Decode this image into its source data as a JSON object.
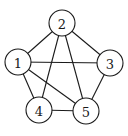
{
  "graph": {
    "nodes": [
      {
        "id": "1",
        "label": "1",
        "x": 18,
        "y": 62
      },
      {
        "id": "2",
        "label": "2",
        "x": 62,
        "y": 23
      },
      {
        "id": "3",
        "label": "3",
        "x": 110,
        "y": 63
      },
      {
        "id": "4",
        "label": "4",
        "x": 39,
        "y": 110
      },
      {
        "id": "5",
        "label": "5",
        "x": 86,
        "y": 111
      }
    ],
    "edges": [
      [
        "1",
        "2"
      ],
      [
        "2",
        "3"
      ],
      [
        "1",
        "3"
      ],
      [
        "1",
        "4"
      ],
      [
        "1",
        "5"
      ],
      [
        "2",
        "4"
      ],
      [
        "2",
        "5"
      ],
      [
        "3",
        "5"
      ],
      [
        "4",
        "5"
      ]
    ],
    "node_radius": 13,
    "stroke_color": "#1a1a1a",
    "fill_color": "#ffffff"
  }
}
